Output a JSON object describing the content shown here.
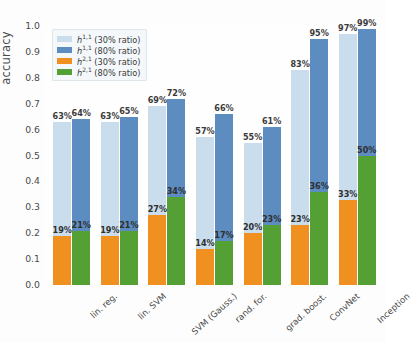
{
  "chart_data": {
    "type": "bar",
    "title": "",
    "xlabel": "",
    "ylabel": "accuracy",
    "ylim": [
      0.0,
      1.0
    ],
    "yticks": [
      "0.0",
      "0.1",
      "0.2",
      "0.3",
      "0.4",
      "0.5",
      "0.6",
      "0.7",
      "0.8",
      "0.9",
      "1.0"
    ],
    "grid": false,
    "legend_position": "upper left",
    "stacked": true,
    "bar_mode": "grouped-stacked",
    "categories": [
      "lin. reg.",
      "lin. SVM",
      "SVM (Gauss.)",
      "rand. for.",
      "grad. boost.",
      "ConvNet",
      "Inception"
    ],
    "series": [
      {
        "name": "h^{1,1} (30% ratio)",
        "key": "h11_30",
        "color": "#c9dded",
        "values": [
          0.63,
          0.63,
          0.69,
          0.57,
          0.55,
          0.83,
          0.97
        ],
        "labels": [
          "63%",
          "63%",
          "69%",
          "57%",
          "55%",
          "83%",
          "97%"
        ]
      },
      {
        "name": "h^{1,1} (80% ratio)",
        "key": "h11_80",
        "color": "#5c8cc0",
        "values": [
          0.64,
          0.65,
          0.72,
          0.66,
          0.61,
          0.95,
          0.99
        ],
        "labels": [
          "64%",
          "65%",
          "72%",
          "66%",
          "61%",
          "95%",
          "99%"
        ]
      },
      {
        "name": "h^{2,1} (30% ratio)",
        "key": "h21_30",
        "color": "#ef9021",
        "values": [
          0.19,
          0.19,
          0.27,
          0.14,
          0.2,
          0.23,
          0.33
        ],
        "labels": [
          "19%",
          "19%",
          "27%",
          "14%",
          "20%",
          "23%",
          "33%"
        ]
      },
      {
        "name": "h^{2,1} (80% ratio)",
        "key": "h21_80",
        "color": "#55a034",
        "values": [
          0.21,
          0.21,
          0.34,
          0.17,
          0.23,
          0.36,
          0.5
        ],
        "labels": [
          "21%",
          "21%",
          "34%",
          "17%",
          "23%",
          "36%",
          "50%"
        ]
      }
    ]
  },
  "legend": {
    "items": [
      {
        "symbol": "h",
        "sup": "1,1",
        "suffix": " (30% ratio)",
        "color": "#c9dded"
      },
      {
        "symbol": "h",
        "sup": "1,1",
        "suffix": " (80% ratio)",
        "color": "#5c8cc0"
      },
      {
        "symbol": "h",
        "sup": "2,1",
        "suffix": " (30% ratio)",
        "color": "#ef9021"
      },
      {
        "symbol": "h",
        "sup": "2,1",
        "suffix": " (80% ratio)",
        "color": "#55a034"
      }
    ]
  }
}
